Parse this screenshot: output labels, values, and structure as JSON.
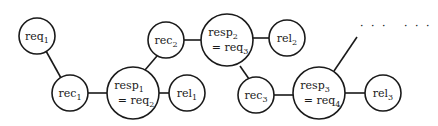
{
  "diagram": {
    "type": "chain-graph",
    "nodes": [
      {
        "id": "req1",
        "base": "req",
        "sub": "1",
        "line2_prefix": "",
        "line2_base": "",
        "line2_sub": ""
      },
      {
        "id": "rec1",
        "base": "rec",
        "sub": "1"
      },
      {
        "id": "resp1",
        "base": "resp",
        "sub": "1",
        "line2_prefix": "= ",
        "line2_base": "req",
        "line2_sub": "2"
      },
      {
        "id": "rel1",
        "base": "rel",
        "sub": "1"
      },
      {
        "id": "rec2",
        "base": "rec",
        "sub": "2"
      },
      {
        "id": "resp2",
        "base": "resp",
        "sub": "2",
        "line2_prefix": "= ",
        "line2_base": "req",
        "line2_sub": "3"
      },
      {
        "id": "rel2",
        "base": "rel",
        "sub": "2"
      },
      {
        "id": "rec3",
        "base": "rec",
        "sub": "3"
      },
      {
        "id": "resp3",
        "base": "resp",
        "sub": "3",
        "line2_prefix": "= ",
        "line2_base": "req",
        "line2_sub": "4"
      },
      {
        "id": "rel3",
        "base": "rel",
        "sub": "3"
      }
    ],
    "edges": [
      [
        "req1",
        "rec1"
      ],
      [
        "rec1",
        "resp1"
      ],
      [
        "resp1",
        "rel1"
      ],
      [
        "resp1",
        "rec2"
      ],
      [
        "rec2",
        "resp2"
      ],
      [
        "resp2",
        "rel2"
      ],
      [
        "resp2",
        "rec3"
      ],
      [
        "rec3",
        "resp3"
      ],
      [
        "resp3",
        "rel3"
      ],
      [
        "resp3",
        "continuation"
      ]
    ],
    "continuation": [
      "· · ·",
      "· · ·"
    ]
  }
}
